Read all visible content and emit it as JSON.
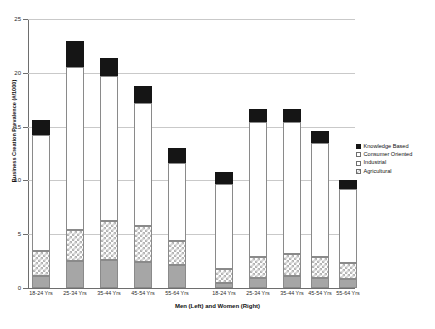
{
  "chart_data": {
    "type": "bar",
    "stacked": true,
    "title": "",
    "xlabel": "Men (Left) and Women (Right)",
    "ylabel": "Business Creation Prevalence (#/1000)",
    "ylim": [
      0,
      25
    ],
    "ytick_labels": [
      "0",
      "5",
      "10",
      "15",
      "20",
      "25"
    ],
    "ytick_values": [
      0,
      5,
      10,
      15,
      20,
      25
    ],
    "grid": true,
    "legend_position": "right",
    "groups": [
      "Men (Left)",
      "Women (Right)"
    ],
    "categories": [
      "18-24 Yrs",
      "25-34 Yrs",
      "35-44 Yrs",
      "45-54 Yrs",
      "55-64 Yrs",
      "18-24 Yrs",
      "25-34 Yrs",
      "35-44 Yrs",
      "45-54 Yrs",
      "55-64 Yrs"
    ],
    "series": [
      {
        "name": "Agricultural",
        "color": "#a6a6a6",
        "values": [
          1.1,
          2.5,
          2.6,
          2.4,
          2.1,
          0.5,
          0.9,
          1.1,
          0.9,
          0.8
        ]
      },
      {
        "name": "Industrial",
        "color": "#ffffff",
        "values": [
          2.3,
          2.9,
          3.6,
          3.4,
          2.3,
          1.3,
          2.0,
          2.1,
          2.0,
          1.5
        ]
      },
      {
        "name": "Consumer Oriented",
        "color": "#ffffff",
        "values": [
          10.8,
          15.1,
          13.5,
          11.4,
          7.2,
          7.9,
          12.5,
          12.2,
          10.6,
          6.9
        ]
      },
      {
        "name": "Knowledge Based",
        "color": "#151515",
        "values": [
          1.4,
          2.5,
          1.7,
          1.6,
          1.4,
          1.1,
          1.2,
          1.2,
          1.1,
          0.8
        ]
      }
    ],
    "totals": [
      15.6,
      23.0,
      21.4,
      18.8,
      13.0,
      10.8,
      16.6,
      16.6,
      14.6,
      10.0
    ]
  },
  "legend": {
    "items": [
      {
        "label": "Knowledge Based",
        "swatch": "black-filled-swatch"
      },
      {
        "label": "Consumer Oriented",
        "swatch": "white-open-swatch"
      },
      {
        "label": "Industrial",
        "swatch": "white-open-swatch"
      },
      {
        "label": "Agricultural",
        "swatch": "hatched-gray-swatch"
      }
    ]
  }
}
